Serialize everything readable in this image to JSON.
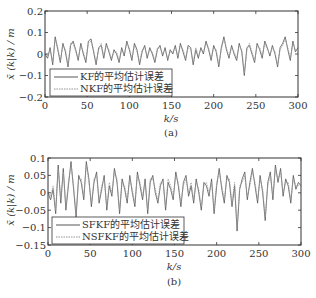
{
  "chart_data": [
    {
      "type": "line",
      "panel": "(a)",
      "title": "",
      "xlabel": "k/s",
      "ylabel": "x̄(k|k)/m",
      "xlim": [
        0,
        300
      ],
      "ylim": [
        -0.2,
        0.2
      ],
      "xticks": [
        0,
        50,
        100,
        150,
        200,
        250,
        300
      ],
      "xtick_labels": [
        "0",
        "50",
        "100",
        "150",
        "200",
        "250",
        "300"
      ],
      "yticks": [
        0.2,
        0.1,
        0,
        -0.1,
        -0.2
      ],
      "ytick_labels": [
        "0.2",
        "0.1",
        "0",
        "−0.1",
        "−0.2"
      ],
      "grid": false,
      "legend_position": "lower left",
      "caption": "(a)",
      "series": [
        {
          "name": "KF的平均估计误差",
          "style": "solid",
          "color": "#444444",
          "values": [
            0.0,
            -0.02,
            0.03,
            -0.05,
            0.08,
            0.02,
            -0.04,
            0.05,
            0.01,
            -0.06,
            0.04,
            0.06,
            0.02,
            -0.03,
            0.05,
            0.0,
            -0.04,
            0.06,
            0.07,
            0.01,
            -0.05,
            0.03,
            0.04,
            -0.02,
            0.05,
            0.01,
            -0.03,
            0.02,
            0.0,
            -0.04,
            0.03,
            -0.01,
            0.06,
            0.02,
            -0.03,
            0.05,
            0.02,
            -0.05,
            0.01,
            0.04,
            -0.02,
            0.03,
            0.0,
            -0.04,
            0.02,
            0.04,
            -0.01,
            0.03,
            -0.03,
            0.02,
            0.0,
            0.04,
            -0.02,
            0.05,
            0.01,
            -0.03,
            0.04,
            0.03,
            -0.05,
            0.02,
            -0.02,
            0.03,
            0.0,
            0.06,
            0.02,
            -0.03,
            0.04,
            0.01,
            -0.06,
            0.03,
            0.08,
            0.02,
            -0.02,
            0.04,
            0.0,
            -0.03,
            0.05,
            0.01,
            -0.1,
            0.03,
            0.04,
            0.0,
            -0.04,
            0.05,
            0.02,
            -0.02,
            0.06,
            0.03,
            -0.01,
            0.04,
            0.0,
            -0.06,
            0.03,
            0.05,
            0.08,
            0.02,
            -0.03,
            0.06,
            0.01,
            0.03
          ]
        },
        {
          "name": "NKF的平均估计误差",
          "style": "dotted",
          "color": "#888888",
          "values": [
            0.01,
            -0.01,
            0.02,
            -0.04,
            0.07,
            0.03,
            -0.03,
            0.04,
            0.02,
            -0.05,
            0.05,
            0.05,
            0.01,
            -0.02,
            0.04,
            0.01,
            -0.03,
            0.05,
            0.06,
            0.02,
            -0.04,
            0.02,
            0.05,
            -0.01,
            0.04,
            0.02,
            -0.02,
            0.01,
            0.01,
            -0.03,
            0.02,
            0.0,
            0.05,
            0.03,
            -0.02,
            0.04,
            0.01,
            -0.04,
            0.02,
            0.03,
            -0.01,
            0.02,
            0.01,
            -0.03,
            0.03,
            0.03,
            0.0,
            0.02,
            -0.02,
            0.01,
            0.01,
            0.03,
            -0.01,
            0.04,
            0.02,
            -0.02,
            0.03,
            0.02,
            -0.04,
            0.03,
            -0.01,
            0.02,
            0.01,
            0.05,
            0.03,
            -0.02,
            0.03,
            0.02,
            -0.05,
            0.02,
            0.07,
            0.03,
            -0.01,
            0.03,
            0.01,
            -0.02,
            0.04,
            0.02,
            -0.09,
            0.02,
            0.05,
            0.01,
            -0.03,
            0.04,
            0.03,
            -0.01,
            0.05,
            0.02,
            0.0,
            0.03,
            0.01,
            -0.05,
            0.02,
            0.04,
            0.07,
            0.03,
            -0.02,
            0.05,
            0.02,
            0.02
          ]
        }
      ]
    },
    {
      "type": "line",
      "panel": "(b)",
      "title": "",
      "xlabel": "k/s",
      "ylabel": "x̄(k|k)/m",
      "xlim": [
        0,
        300
      ],
      "ylim": [
        -0.15,
        0.1
      ],
      "xticks": [
        0,
        50,
        100,
        150,
        200,
        250,
        300
      ],
      "xtick_labels": [
        "0",
        "50",
        "100",
        "150",
        "200",
        "250",
        "300"
      ],
      "yticks": [
        0.1,
        0.05,
        0,
        -0.05,
        -0.1,
        -0.15
      ],
      "ytick_labels": [
        "0.1",
        "0.05",
        "0",
        "−0.05",
        "−0.1",
        "−0.15"
      ],
      "grid": false,
      "legend_position": "lower left",
      "caption": "(b)",
      "series": [
        {
          "name": "SFKF的平均估计误差",
          "style": "solid",
          "color": "#444444",
          "values": [
            0.0,
            -0.02,
            0.01,
            -0.06,
            0.08,
            -0.03,
            0.07,
            -0.05,
            0.02,
            0.09,
            0.01,
            -0.07,
            0.05,
            0.03,
            -0.02,
            0.09,
            0.04,
            -0.04,
            0.03,
            0.06,
            -0.03,
            0.01,
            0.05,
            -0.05,
            0.02,
            -0.01,
            0.07,
            0.03,
            -0.06,
            0.04,
            0.01,
            -0.03,
            0.05,
            0.0,
            -0.04,
            0.06,
            0.02,
            -0.02,
            0.04,
            -0.06,
            0.03,
            0.05,
            0.0,
            -0.03,
            0.02,
            0.04,
            -0.05,
            0.03,
            0.01,
            -0.02,
            0.06,
            0.02,
            -0.04,
            0.03,
            0.05,
            -0.01,
            0.02,
            -0.03,
            0.04,
            0.0,
            -0.05,
            0.03,
            0.02,
            -0.01,
            0.04,
            -0.06,
            0.02,
            0.07,
            0.01,
            -0.03,
            0.05,
            0.03,
            -0.04,
            0.02,
            -0.11,
            0.01,
            0.04,
            0.06,
            -0.02,
            0.03,
            0.07,
            0.02,
            -0.03,
            0.05,
            0.0,
            -0.08,
            0.03,
            0.06,
            -0.02,
            0.08,
            0.03,
            0.07,
            -0.01,
            0.04,
            0.02,
            -0.03,
            0.05,
            0.01,
            0.03,
            0.02
          ]
        },
        {
          "name": "NSFKF的平均估计误差",
          "style": "dotted",
          "color": "#888888",
          "values": [
            0.01,
            -0.01,
            0.02,
            -0.05,
            0.07,
            -0.02,
            0.06,
            -0.04,
            0.03,
            0.08,
            0.02,
            -0.06,
            0.04,
            0.04,
            -0.01,
            0.08,
            0.03,
            -0.03,
            0.04,
            0.05,
            -0.02,
            0.02,
            0.04,
            -0.04,
            0.03,
            0.0,
            0.06,
            0.04,
            -0.05,
            0.03,
            0.02,
            -0.02,
            0.04,
            0.01,
            -0.03,
            0.05,
            0.03,
            -0.01,
            0.03,
            -0.05,
            0.04,
            0.04,
            0.01,
            -0.02,
            0.03,
            0.03,
            -0.04,
            0.04,
            0.02,
            -0.01,
            0.05,
            0.03,
            -0.03,
            0.02,
            0.04,
            0.0,
            0.03,
            -0.02,
            0.03,
            0.01,
            -0.04,
            0.02,
            0.03,
            0.0,
            0.03,
            -0.05,
            0.03,
            0.06,
            0.02,
            -0.02,
            0.04,
            0.04,
            -0.03,
            0.03,
            -0.1,
            0.02,
            0.03,
            0.05,
            -0.01,
            0.02,
            0.06,
            0.03,
            -0.02,
            0.04,
            0.01,
            -0.07,
            0.02,
            0.05,
            -0.01,
            0.07,
            0.04,
            0.06,
            0.0,
            0.03,
            0.03,
            -0.02,
            0.04,
            0.02,
            0.02,
            0.03
          ]
        }
      ]
    }
  ],
  "panels": {
    "a": {
      "ylabel": "x̄ (k|k) / m",
      "xlabel": "k/s",
      "caption": "(a)",
      "yticks": [
        "0.2",
        "0.1",
        "0",
        "−0.1",
        "−0.2"
      ],
      "xticks": [
        "0",
        "50",
        "100",
        "150",
        "200",
        "250",
        "300"
      ],
      "legend": [
        "KF的平均估计误差",
        "NKF的平均估计误差"
      ]
    },
    "b": {
      "ylabel": "x̄ (k|k) / m",
      "xlabel": "k/s",
      "caption": "(b)",
      "yticks": [
        "0.1",
        "0.05",
        "0",
        "−0.05",
        "−0.1",
        "−0.15"
      ],
      "xticks": [
        "0",
        "50",
        "100",
        "150",
        "200",
        "250",
        "300"
      ],
      "legend": [
        "SFKF的平均估计误差",
        "NSFKF的平均估计误差"
      ]
    }
  }
}
